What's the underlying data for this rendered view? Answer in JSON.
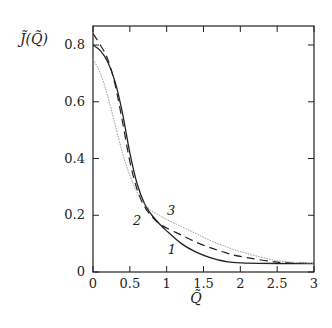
{
  "chart_data": {
    "type": "line",
    "title": "",
    "xlabel": "Q̃",
    "ylabel": "J̃(Q̃)",
    "xlim": [
      0,
      3
    ],
    "ylim": [
      0,
      0.867
    ],
    "grid": false,
    "legend": "inline curve labels",
    "x_ticks": [
      0,
      0.5,
      1,
      1.5,
      2,
      2.5,
      3
    ],
    "x_tick_labels": [
      "0",
      "0.5",
      "1",
      "1.5",
      "2",
      "2.5",
      "3"
    ],
    "y_ticks": [
      0,
      0.2,
      0.4,
      0.6,
      0.8
    ],
    "y_tick_labels": [
      "0",
      "0.2",
      "0.4",
      "0.6",
      "0.8"
    ],
    "series": [
      {
        "name": "1",
        "style": "solid",
        "color": "#222222",
        "x": [
          0,
          0.1,
          0.2,
          0.3,
          0.4,
          0.5,
          0.6,
          0.7,
          0.8,
          0.9,
          1.0,
          1.2,
          1.4,
          1.6,
          1.8,
          2.0,
          2.5,
          3.0
        ],
        "y": [
          0.8,
          0.78,
          0.74,
          0.67,
          0.56,
          0.42,
          0.31,
          0.24,
          0.2,
          0.17,
          0.145,
          0.1,
          0.07,
          0.05,
          0.037,
          0.032,
          0.03,
          0.03
        ]
      },
      {
        "name": "2",
        "style": "dashed",
        "color": "#222222",
        "x": [
          0,
          0.1,
          0.2,
          0.3,
          0.4,
          0.5,
          0.6,
          0.7,
          0.8,
          0.9,
          1.0,
          1.2,
          1.4,
          1.6,
          1.8,
          2.0,
          2.5,
          3.0
        ],
        "y": [
          0.84,
          0.8,
          0.75,
          0.66,
          0.53,
          0.39,
          0.29,
          0.23,
          0.195,
          0.17,
          0.155,
          0.13,
          0.105,
          0.085,
          0.068,
          0.055,
          0.035,
          0.03
        ]
      },
      {
        "name": "3",
        "style": "dotted",
        "color": "#999999",
        "x": [
          0,
          0.1,
          0.2,
          0.3,
          0.4,
          0.5,
          0.6,
          0.7,
          0.8,
          0.9,
          1.0,
          1.2,
          1.4,
          1.6,
          1.8,
          2.0,
          2.5,
          3.0
        ],
        "y": [
          0.75,
          0.7,
          0.62,
          0.52,
          0.42,
          0.34,
          0.28,
          0.24,
          0.215,
          0.2,
          0.185,
          0.16,
          0.135,
          0.11,
          0.09,
          0.072,
          0.04,
          0.03
        ]
      }
    ],
    "annotations": [
      {
        "text": "1",
        "x": 1.07,
        "y": 0.065
      },
      {
        "text": "2",
        "x": 0.6,
        "y": 0.165
      },
      {
        "text": "3",
        "x": 1.06,
        "y": 0.2
      }
    ]
  }
}
